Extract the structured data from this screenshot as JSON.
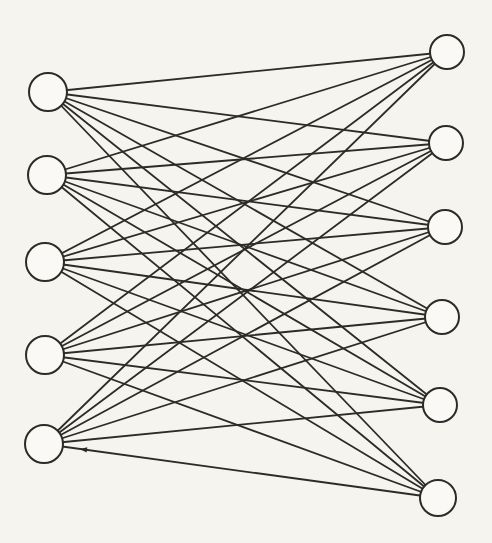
{
  "diagram": {
    "type": "complete-bipartite-graph",
    "background_color": "#f6f4ef",
    "edge_color": "#2d2b28",
    "edge_width": 1.8,
    "node_fill": "#faf9f5",
    "node_stroke": "#2d2b28",
    "node_stroke_width": 2,
    "canvas": {
      "width": 492,
      "height": 543
    },
    "left_nodes": [
      {
        "id": "L1",
        "x": 48,
        "y": 92,
        "r": 19
      },
      {
        "id": "L2",
        "x": 47,
        "y": 175,
        "r": 19
      },
      {
        "id": "L3",
        "x": 45,
        "y": 262,
        "r": 19
      },
      {
        "id": "L4",
        "x": 45,
        "y": 355,
        "r": 19
      },
      {
        "id": "L5",
        "x": 44,
        "y": 444,
        "r": 19
      }
    ],
    "right_nodes": [
      {
        "id": "R1",
        "x": 447,
        "y": 52,
        "r": 17
      },
      {
        "id": "R2",
        "x": 446,
        "y": 143,
        "r": 17
      },
      {
        "id": "R3",
        "x": 445,
        "y": 227,
        "r": 17
      },
      {
        "id": "R4",
        "x": 442,
        "y": 317,
        "r": 17
      },
      {
        "id": "R5",
        "x": 440,
        "y": 405,
        "r": 17
      },
      {
        "id": "R6",
        "x": 438,
        "y": 498,
        "r": 18
      }
    ],
    "edges": [
      [
        "L1",
        "R1"
      ],
      [
        "L1",
        "R2"
      ],
      [
        "L1",
        "R3"
      ],
      [
        "L1",
        "R4"
      ],
      [
        "L1",
        "R5"
      ],
      [
        "L1",
        "R6"
      ],
      [
        "L2",
        "R1"
      ],
      [
        "L2",
        "R2"
      ],
      [
        "L2",
        "R3"
      ],
      [
        "L2",
        "R4"
      ],
      [
        "L2",
        "R5"
      ],
      [
        "L2",
        "R6"
      ],
      [
        "L3",
        "R1"
      ],
      [
        "L3",
        "R2"
      ],
      [
        "L3",
        "R3"
      ],
      [
        "L3",
        "R4"
      ],
      [
        "L3",
        "R5"
      ],
      [
        "L3",
        "R6"
      ],
      [
        "L4",
        "R1"
      ],
      [
        "L4",
        "R2"
      ],
      [
        "L4",
        "R3"
      ],
      [
        "L4",
        "R4"
      ],
      [
        "L4",
        "R5"
      ],
      [
        "L4",
        "R6"
      ],
      [
        "L5",
        "R1"
      ],
      [
        "L5",
        "R2"
      ],
      [
        "L5",
        "R3"
      ],
      [
        "L5",
        "R4"
      ],
      [
        "L5",
        "R5"
      ],
      [
        "L5",
        "R6"
      ]
    ],
    "arrow_mark": {
      "edge": [
        "L5",
        "R6"
      ],
      "t": 0.1,
      "points_toward": "L5",
      "size": 6
    }
  }
}
